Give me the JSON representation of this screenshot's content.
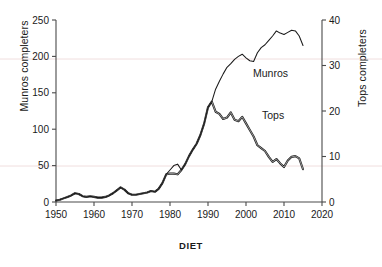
{
  "chart_data": {
    "type": "line",
    "title": "",
    "caption": "DIET",
    "xlabel": "",
    "ylabel": "Munros completers",
    "y2label": "Tops completers",
    "xlim": [
      1950,
      2020
    ],
    "ylim": [
      0,
      250
    ],
    "y2lim": [
      0,
      40
    ],
    "xticks": [
      1950,
      1960,
      1970,
      1980,
      1990,
      2000,
      2010,
      2020
    ],
    "yticks": [
      0,
      50,
      100,
      150,
      200,
      250
    ],
    "y2ticks": [
      0,
      10,
      20,
      30,
      40
    ],
    "grid": false,
    "legend": "inline-annotations",
    "annotations": [
      {
        "text": "Munros",
        "x": 2000,
        "y": 168
      },
      {
        "text": "Tops",
        "x": 2002,
        "y": 112
      }
    ],
    "series": [
      {
        "name": "Munros",
        "axis": "left",
        "color": "#1a1a1a",
        "x": [
          1950,
          1951,
          1952,
          1953,
          1954,
          1955,
          1956,
          1957,
          1958,
          1959,
          1960,
          1961,
          1962,
          1963,
          1964,
          1965,
          1966,
          1967,
          1968,
          1969,
          1970,
          1971,
          1972,
          1973,
          1974,
          1975,
          1976,
          1977,
          1978,
          1979,
          1980,
          1981,
          1982,
          1983,
          1984,
          1985,
          1986,
          1987,
          1988,
          1989,
          1990,
          1991,
          1992,
          1993,
          1994,
          1995,
          1996,
          1997,
          1998,
          1999,
          2000,
          2001,
          2002,
          2003,
          2004,
          2005,
          2006,
          2007,
          2008,
          2009,
          2010,
          2011,
          2012,
          2013,
          2014,
          2015
        ],
        "values": [
          2,
          3,
          5,
          7,
          9,
          12,
          11,
          8,
          7,
          8,
          7,
          6,
          6,
          7,
          9,
          12,
          16,
          20,
          17,
          12,
          10,
          10,
          11,
          12,
          13,
          15,
          14,
          18,
          26,
          38,
          44,
          50,
          52,
          44,
          52,
          63,
          72,
          80,
          92,
          108,
          130,
          138,
          155,
          166,
          176,
          185,
          190,
          196,
          200,
          203,
          198,
          194,
          193,
          205,
          212,
          216,
          222,
          228,
          235,
          232,
          230,
          233,
          236,
          235,
          228,
          215
        ]
      },
      {
        "name": "Tops",
        "axis": "right",
        "color": "#1a1a1a",
        "x": [
          1950,
          1951,
          1952,
          1953,
          1954,
          1955,
          1956,
          1957,
          1958,
          1959,
          1960,
          1961,
          1962,
          1963,
          1964,
          1965,
          1966,
          1967,
          1968,
          1969,
          1970,
          1971,
          1972,
          1973,
          1974,
          1975,
          1976,
          1977,
          1978,
          1979,
          1980,
          1981,
          1982,
          1983,
          1984,
          1985,
          1986,
          1987,
          1988,
          1989,
          1990,
          1991,
          1992,
          1993,
          1994,
          1995,
          1996,
          1997,
          1998,
          1999,
          2000,
          2001,
          2002,
          2003,
          2004,
          2005,
          2006,
          2007,
          2008,
          2009,
          2010,
          2011,
          2012,
          2013,
          2014,
          2015
        ],
        "values_right_axis": [
          0.3,
          0.5,
          0.8,
          1.1,
          1.4,
          1.9,
          1.7,
          1.3,
          1.1,
          1.3,
          1.1,
          1.0,
          1.0,
          1.1,
          1.4,
          1.9,
          2.6,
          3.2,
          2.7,
          1.9,
          1.6,
          1.6,
          1.8,
          1.9,
          2.1,
          2.4,
          2.2,
          2.9,
          4.2,
          6.1,
          6.3,
          6.2,
          6.0,
          7.0,
          8.3,
          10.1,
          11.5,
          12.8,
          14.7,
          17.3,
          20.8,
          22.1,
          19.8,
          19.3,
          18.2,
          18.6,
          19.6,
          18.1,
          17.8,
          18.7,
          17.3,
          15.9,
          14.4,
          12.5,
          11.8,
          11.2,
          9.9,
          8.8,
          9.4,
          8.4,
          7.7,
          9.1,
          9.9,
          10.1,
          9.6,
          7.2
        ],
        "values_left_equivalent": [
          2,
          3,
          5,
          7,
          9,
          12,
          11,
          8,
          7,
          8,
          7,
          6,
          6,
          7,
          9,
          12,
          16,
          20,
          17,
          12,
          10,
          10,
          11,
          12,
          13,
          15,
          14,
          18,
          26,
          38,
          39,
          39,
          38,
          44,
          52,
          63,
          72,
          80,
          92,
          108,
          130,
          138,
          124,
          121,
          114,
          116,
          123,
          113,
          111,
          117,
          108,
          99,
          90,
          78,
          74,
          70,
          62,
          55,
          59,
          53,
          48,
          57,
          62,
          63,
          60,
          45
        ]
      }
    ]
  },
  "axes": {
    "left_title": "Munros completers",
    "right_title": "Tops completers",
    "x_tick_labels": [
      "1950",
      "1960",
      "1970",
      "1980",
      "1990",
      "2000",
      "2010",
      "2020"
    ],
    "y_left_tick_labels": [
      "0",
      "50",
      "100",
      "150",
      "200",
      "250"
    ],
    "y_right_tick_labels": [
      "0",
      "10",
      "20",
      "30",
      "40"
    ]
  },
  "labels": {
    "munros": "Munros",
    "tops": "Tops",
    "caption": "DIET"
  },
  "colors": {
    "line": "#1a1a1a",
    "axis": "#4a4a4a",
    "background": "#ffffff",
    "faint_rule": "#f0dede"
  }
}
